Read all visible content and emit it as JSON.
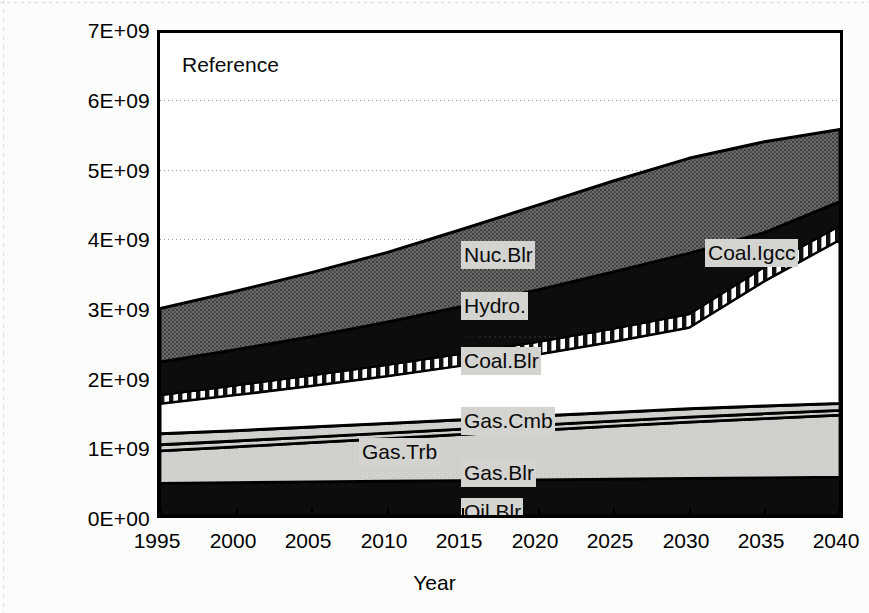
{
  "chart_data": {
    "type": "area",
    "title": "Reference",
    "xlabel": "Year",
    "ylabel": "",
    "x": [
      1995,
      2000,
      2005,
      2010,
      2015,
      2020,
      2025,
      2030,
      2035,
      2040
    ],
    "xlim": [
      1995,
      2040
    ],
    "ylim": [
      0,
      7000000000
    ],
    "ytick_labels": [
      "0E+00",
      "1E+09",
      "2E+09",
      "3E+09",
      "4E+09",
      "5E+09",
      "6E+09",
      "7E+09"
    ],
    "ytick_values": [
      0,
      1000000000,
      2000000000,
      3000000000,
      4000000000,
      5000000000,
      6000000000,
      7000000000
    ],
    "xtick_labels": [
      "1995",
      "2000",
      "2005",
      "2010",
      "2015",
      "2020",
      "2025",
      "2030",
      "2035",
      "2040"
    ],
    "grid": "horizontal-dotted-major",
    "legend": "in-plot-labels",
    "stacked": true,
    "stack_order_bottom_to_top": [
      "Oil.Blr",
      "Gas.Blr",
      "Gas.Trb",
      "Gas.Cmb",
      "Coal.Blr",
      "Coal.Igcc",
      "Hydro.",
      "Nuc.Blr"
    ],
    "series": [
      {
        "name": "Oil.Blr",
        "fill": "solid-black",
        "color": "#0d0d0d",
        "values": [
          460000000,
          470000000,
          480000000,
          490000000,
          500000000,
          510000000,
          520000000,
          530000000,
          540000000,
          550000000
        ]
      },
      {
        "name": "Gas.Blr",
        "fill": "light-gray",
        "color": "#cfcfcc",
        "values": [
          470000000,
          520000000,
          570000000,
          620000000,
          670000000,
          720000000,
          770000000,
          820000000,
          860000000,
          900000000
        ]
      },
      {
        "name": "Gas.Trb",
        "fill": "light-gray-thin",
        "color": "#d4d4d1",
        "values": [
          90000000,
          85000000,
          82000000,
          80000000,
          78000000,
          76000000,
          74000000,
          72000000,
          71000000,
          70000000
        ]
      },
      {
        "name": "Gas.Cmb",
        "fill": "light-gray",
        "color": "#cfcfcc",
        "values": [
          160000000,
          150000000,
          145000000,
          140000000,
          135000000,
          130000000,
          125000000,
          120000000,
          112000000,
          100000000
        ]
      },
      {
        "name": "Coal.Blr",
        "fill": "diagonal-crosshatch",
        "color": "#ffffff",
        "values": [
          440000000,
          520000000,
          600000000,
          690000000,
          790000000,
          900000000,
          1030000000,
          1180000000,
          1340000000,
          1580000000
        ]
      },
      {
        "name": "Coal.Igcc",
        "fill": "diagonal-crosshatch",
        "color": "#ffffff",
        "values": [
          0,
          0,
          0,
          0,
          0,
          0,
          0,
          0,
          0,
          0
        ]
      },
      {
        "name": "Hydro.",
        "fill": "vertical-stripes",
        "color": "#ffffff",
        "values": [
          120000000,
          135000000,
          150000000,
          160000000,
          170000000,
          178000000,
          186000000,
          192000000,
          196000000,
          200000000
        ]
      },
      {
        "name": "Nuc.Blr",
        "fill": "dark-gray",
        "color": "#595959",
        "values": [
          780000000,
          800000000,
          830000000,
          870000000,
          910000000,
          950000000,
          990000000,
          1010000000,
          1030000000,
          1050000000
        ]
      }
    ],
    "cumulative_totals": [
      3000000000,
      3250000000,
      3520000000,
      3810000000,
      4150000000,
      4500000000,
      4850000000,
      5180000000,
      5420000000,
      5600000000
    ],
    "stack_boundaries": {
      "note": "cumulative upper edge of each band, in order bottom-to-top, at each x tick",
      "Oil.Blr": [
        460000000,
        470000000,
        480000000,
        490000000,
        500000000,
        510000000,
        520000000,
        530000000,
        540000000,
        550000000
      ],
      "Gas.Blr": [
        930000000,
        990000000,
        1050000000,
        1110000000,
        1170000000,
        1230000000,
        1290000000,
        1350000000,
        1400000000,
        1450000000
      ],
      "Gas.Trb": [
        1020000000,
        1075000000,
        1132000000,
        1190000000,
        1248000000,
        1306000000,
        1364000000,
        1422000000,
        1471000000,
        1520000000
      ],
      "Gas.Cmb": [
        1180000000,
        1225000000,
        1277000000,
        1330000000,
        1383000000,
        1436000000,
        1489000000,
        1542000000,
        1583000000,
        1620000000
      ],
      "Coal.Blr": [
        1620000000,
        1745000000,
        1877000000,
        2020000000,
        2173000000,
        2336000000,
        2519000000,
        2722000000,
        2923000000,
        3200000000
      ],
      "Coal.Igcc": [
        1620000000,
        1745000000,
        1877000000,
        2020000000,
        2173000000,
        2336000000,
        2519000000,
        2722000000,
        3400000000,
        4000000000
      ],
      "Hydro.": [
        1740000000,
        1880000000,
        2027000000,
        2180000000,
        2343000000,
        2514000000,
        2705000000,
        2914000000,
        3600000000,
        4200000000
      ],
      "Nuc.Blr": [
        3000000000,
        3250000000,
        3520000000,
        3810000000,
        4150000000,
        4500000000,
        4850000000,
        5180000000,
        5420000000,
        5600000000
      ]
    },
    "unlabeled_black_band": {
      "note": "solid black band lying between Hydro. and Nuc.Blr",
      "lower": [
        1740000000,
        1880000000,
        2027000000,
        2180000000,
        2343000000,
        2514000000,
        2705000000,
        2914000000,
        3600000000,
        4200000000
      ],
      "upper": [
        2220000000,
        2400000000,
        2590000000,
        2800000000,
        3030000000,
        3270000000,
        3530000000,
        3800000000,
        4100000000,
        4550000000
      ]
    }
  },
  "axes": {
    "y_labels": [
      "7E+09",
      "6E+09",
      "5E+09",
      "4E+09",
      "3E+09",
      "2E+09",
      "1E+09",
      "0E+00"
    ],
    "x_labels": [
      "1995",
      "2000",
      "2005",
      "2010",
      "2015",
      "2020",
      "2025",
      "2030",
      "2035",
      "2040"
    ],
    "x_title": "Year"
  },
  "annotations": {
    "scenario": "Reference",
    "series_labels": [
      {
        "key": "nuc_blr",
        "text": "Nuc.Blr"
      },
      {
        "key": "hydro",
        "text": "Hydro."
      },
      {
        "key": "coal_blr",
        "text": "Coal.Blr"
      },
      {
        "key": "coal_igcc",
        "text": "Coal.Igcc"
      },
      {
        "key": "gas_cmb",
        "text": "Gas.Cmb"
      },
      {
        "key": "gas_trb",
        "text": "Gas.Trb"
      },
      {
        "key": "gas_blr",
        "text": "Gas.Blr"
      },
      {
        "key": "oil_blr",
        "text": "Oil.Blr"
      }
    ]
  },
  "colors": {
    "plot_border": "#000000",
    "dark_gray_fill": "#595959",
    "light_gray_fill": "#cfcfcc",
    "black_fill": "#0d0d0d",
    "label_background": "#d3d3d0",
    "gridline": "#9a9a9a"
  }
}
